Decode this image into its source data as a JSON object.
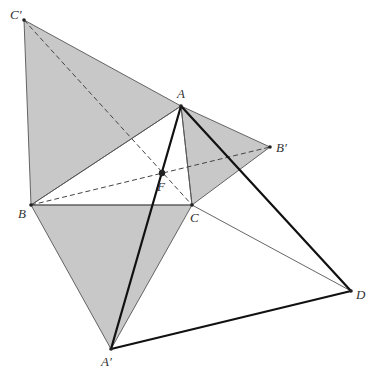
{
  "diagram": {
    "title": "",
    "colors": {
      "shade": "#c8c8c8",
      "thin_edge": "#555555",
      "thick_edge": "#111111",
      "dashed": "#444444",
      "point": "#222222"
    },
    "points": {
      "A": {
        "label": "A",
        "x": 181,
        "y": 106,
        "lx": 177,
        "ly": 98
      },
      "B": {
        "label": "B",
        "x": 31,
        "y": 205,
        "lx": 18,
        "ly": 218
      },
      "C": {
        "label": "C",
        "x": 192,
        "y": 205,
        "lx": 190,
        "ly": 222
      },
      "A_prime": {
        "label": "A′",
        "x": 111,
        "y": 349,
        "lx": 101,
        "ly": 366
      },
      "B_prime": {
        "label": "B′",
        "x": 270,
        "y": 147,
        "lx": 276,
        "ly": 152
      },
      "C_prime": {
        "label": "C′",
        "x": 24,
        "y": 20,
        "lx": 10,
        "ly": 19
      },
      "D": {
        "label": "D",
        "x": 351,
        "y": 291,
        "lx": 356,
        "ly": 299
      },
      "F": {
        "label": "F",
        "x": 162,
        "y": 173,
        "lx": 157,
        "ly": 191
      }
    },
    "shaded_triangles": [
      {
        "name": "triangle-ABC-prime",
        "vertices": [
          "C_prime",
          "A",
          "B"
        ]
      },
      {
        "name": "triangle-AB-prime-C",
        "vertices": [
          "A",
          "B_prime",
          "C"
        ]
      },
      {
        "name": "triangle-BCA-prime",
        "vertices": [
          "B",
          "C",
          "A_prime"
        ]
      }
    ],
    "thin_segments": [
      [
        "C",
        "D"
      ],
      [
        "A",
        "C"
      ],
      [
        "A",
        "B"
      ],
      [
        "B",
        "C"
      ]
    ],
    "dashed_segments": [
      [
        "C_prime",
        "C"
      ],
      [
        "B",
        "B_prime"
      ]
    ],
    "thick_segments": [
      [
        "A_prime",
        "A"
      ],
      [
        "A",
        "D"
      ],
      [
        "A_prime",
        "D"
      ]
    ]
  }
}
